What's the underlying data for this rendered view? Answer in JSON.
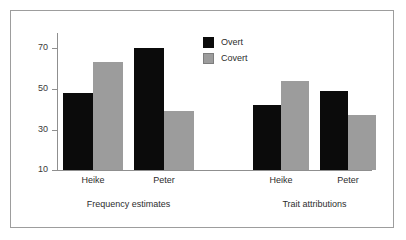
{
  "chart_data": {
    "type": "bar",
    "title": "",
    "subtitle": "",
    "xlabel": "",
    "ylabel": "",
    "ylim": [
      10,
      75
    ],
    "yticks": [
      10,
      30,
      50,
      70
    ],
    "ytick_labels": [
      "10",
      "30",
      "50",
      "70"
    ],
    "grid": false,
    "legend_position": "upper-center",
    "categories": [
      "Heike",
      "Peter"
    ],
    "panels": [
      {
        "label": "Frequency estimates",
        "categories": [
          "Heike",
          "Peter"
        ],
        "series": [
          {
            "name": "Overt",
            "color": "#0b0b0b",
            "values": [
              48,
              70
            ]
          },
          {
            "name": "Covert",
            "color": "#9c9c9c",
            "values": [
              63,
              39
            ]
          }
        ]
      },
      {
        "label": "Trait attributions",
        "categories": [
          "Heike",
          "Peter"
        ],
        "series": [
          {
            "name": "Overt",
            "color": "#0b0b0b",
            "values": [
              42,
              49
            ]
          },
          {
            "name": "Covert",
            "color": "#9c9c9c",
            "values": [
              54,
              37
            ]
          }
        ]
      }
    ],
    "legend": [
      {
        "label": "Overt",
        "color": "#0b0b0b"
      },
      {
        "label": "Covert",
        "color": "#9c9c9c"
      }
    ]
  },
  "axis": {
    "tick_labels": [
      "70",
      "50",
      "30",
      "10"
    ]
  },
  "legend": {
    "overt_label": "Overt",
    "covert_label": "Covert"
  },
  "panel_labels": {
    "left": "Frequency estimates",
    "right": "Trait attributions"
  },
  "category_labels": {
    "p0_c0": "Heike",
    "p0_c1": "Peter",
    "p1_c0": "Heike",
    "p1_c1": "Peter"
  },
  "colors": {
    "overt": "#0b0b0b",
    "covert": "#9c9c9c",
    "axis": "#8f8f8f",
    "frame": "#9d9d9d",
    "background": "#ffffff",
    "text": "#2d2d2d"
  }
}
